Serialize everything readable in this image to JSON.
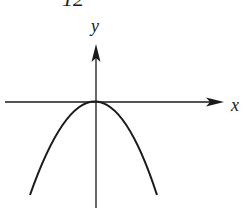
{
  "figure": {
    "number_label": "12",
    "x_axis_label": "x",
    "y_axis_label": "y",
    "curve": "downward-opening parabola with vertex at origin",
    "stroke_color": "#1a1a1a",
    "background": "#ffffff"
  }
}
